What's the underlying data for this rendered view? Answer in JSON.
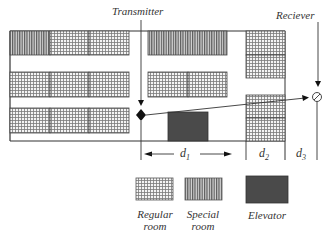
{
  "labels": {
    "transmitter": "Transmitter",
    "receiver": "Reciever"
  },
  "dimensions": {
    "d1": {
      "var": "d",
      "sub": "1"
    },
    "d2": {
      "var": "d",
      "sub": "2"
    },
    "d3": {
      "var": "d",
      "sub": "3"
    }
  },
  "legend": [
    {
      "key": "regular",
      "line1": "Regular",
      "line2": "room"
    },
    {
      "key": "special",
      "line1": "Special",
      "line2": "room"
    },
    {
      "key": "elevator",
      "line1": "Elevator",
      "line2": ""
    }
  ],
  "colors": {
    "wall": "#333333",
    "elevator": "#4a4a4a",
    "regular_fill": "#d9d9d9",
    "special_fill": "#8c8c8c"
  }
}
